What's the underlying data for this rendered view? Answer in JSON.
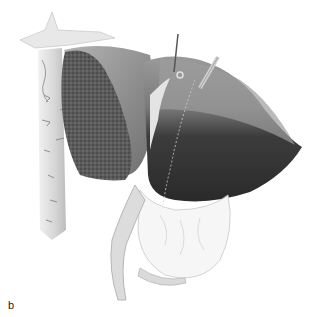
{
  "figure": {
    "panel_label": "b",
    "colors": {
      "background": "#ffffff",
      "dark_lobe": "#3a3a3a",
      "mid_lobe": "#8a8a8a",
      "cut_surface": "#5e5e5e",
      "tissue_light": "#e6e6e6"
    }
  }
}
